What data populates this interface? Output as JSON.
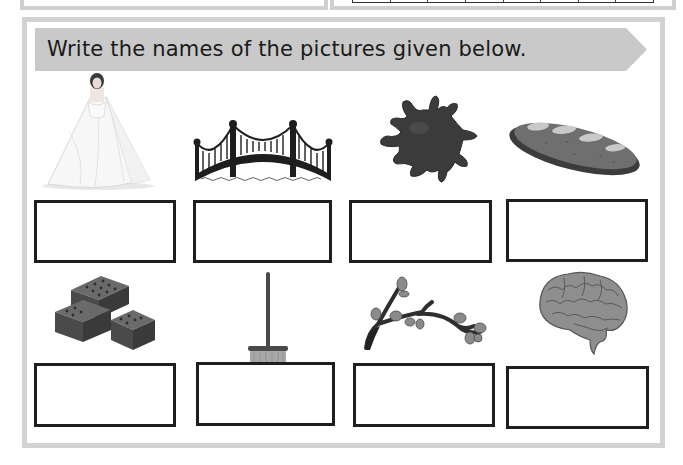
{
  "worksheet": {
    "instruction": "Write the names of the pictures given below.",
    "banner_color": "#c9c9c9",
    "panel_border_color": "#d2d2d2",
    "box_border_color": "#1e1e1e",
    "pictures": [
      {
        "id": 1,
        "subject": "bride",
        "answer": ""
      },
      {
        "id": 2,
        "subject": "bridge",
        "answer": ""
      },
      {
        "id": 3,
        "subject": "ink",
        "answer": ""
      },
      {
        "id": 4,
        "subject": "bread",
        "answer": ""
      },
      {
        "id": 5,
        "subject": "bricks",
        "answer": ""
      },
      {
        "id": 6,
        "subject": "broom",
        "answer": ""
      },
      {
        "id": 7,
        "subject": "branch",
        "answer": ""
      },
      {
        "id": 8,
        "subject": "brain",
        "answer": ""
      }
    ]
  }
}
